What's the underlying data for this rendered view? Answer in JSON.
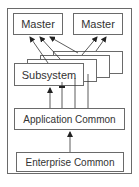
{
  "diagram": {
    "masters": [
      {
        "label": "Master"
      },
      {
        "label": "Master"
      }
    ],
    "subsystem": {
      "label": "Subsystem",
      "stack_count": 4
    },
    "application_common": {
      "label": "Application Common"
    },
    "enterprise_common": {
      "label": "Enterprise Common"
    },
    "colors": {
      "line": "#333333",
      "border": "#6a6a6a",
      "text": "#333333",
      "background": "#ffffff"
    }
  }
}
